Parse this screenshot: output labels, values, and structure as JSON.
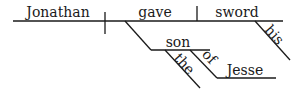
{
  "diagram": {
    "type": "sentence-diagram",
    "sentence": "Jonathan gave his sword to the son of Jesse",
    "subject": "Jonathan",
    "verb": "gave",
    "direct_object": "sword",
    "modifiers": {
      "sword": [
        "his"
      ],
      "son": [
        "the"
      ],
      "preposition": "of",
      "preposition_object": "Jesse"
    },
    "indirect_object": "son",
    "words": {
      "jonathan": "Jonathan",
      "gave": "gave",
      "sword": "sword",
      "his": "his",
      "son": "son",
      "the": "the",
      "of": "of",
      "jesse": "Jesse"
    }
  }
}
